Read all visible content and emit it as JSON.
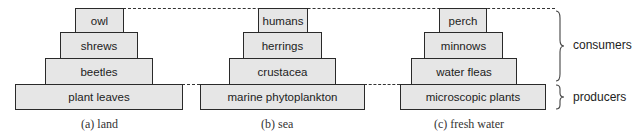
{
  "diagram": {
    "pyramids": [
      {
        "caption": "(a)  land",
        "levels": [
          "owl",
          "shrews",
          "beetles",
          "plant leaves"
        ]
      },
      {
        "caption": "(b)  sea",
        "levels": [
          "humans",
          "herrings",
          "crustacea",
          "marine phytoplankton"
        ]
      },
      {
        "caption": "(c)  fresh water",
        "levels": [
          "perch",
          "minnows",
          "water fleas",
          "microscopic plants"
        ]
      }
    ],
    "groups": {
      "consumers": "consumers",
      "producers": "producers"
    },
    "colors": {
      "box_fill": "#e6e6e6",
      "box_border": "#2a2a2a"
    }
  }
}
